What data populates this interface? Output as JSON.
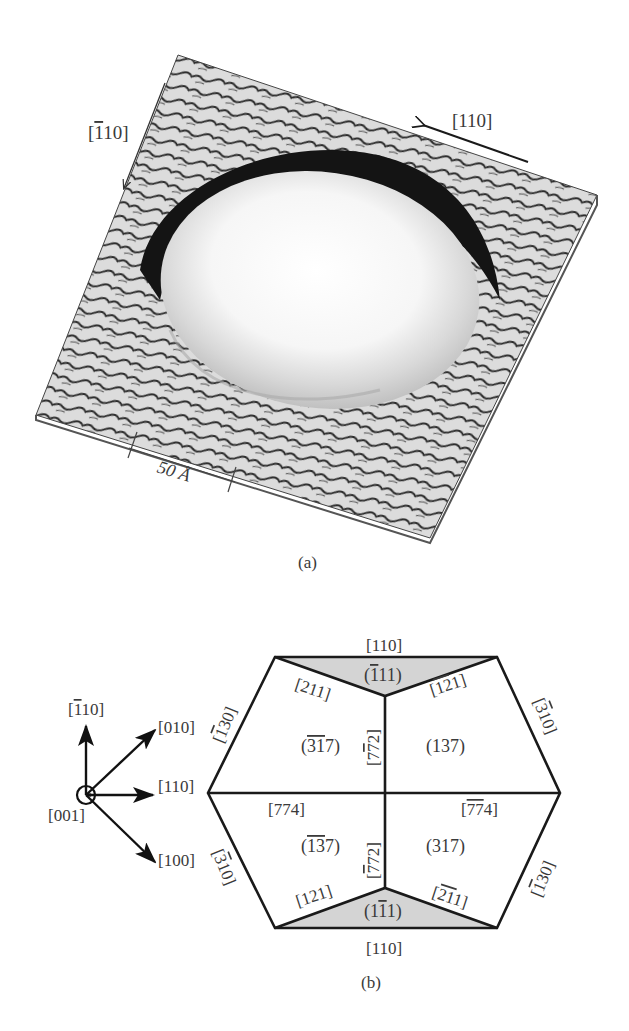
{
  "panel_a": {
    "caption": "(a)",
    "arrow_left_label": {
      "bar": "1",
      "rest": "10",
      "full": "[1̅ 10]"
    },
    "arrow_right_label": "[110]",
    "scale_bar_label": "50 Å",
    "image_description": "3D STM topograph of an island on a stepped surface"
  },
  "panel_b": {
    "caption": "(b)",
    "axes": {
      "origin_label": "[001]",
      "up_label": "[110] with bar on first 1",
      "up": {
        "bar": "1",
        "rest": "10"
      },
      "upper_right": "[010]",
      "right": "[110]",
      "lower_right": "[100]"
    },
    "edges": {
      "top": "[110]",
      "bottom": "[110]",
      "upper_left": {
        "pre": "",
        "bar": "1",
        "post": "30"
      },
      "upper_right": {
        "pre": "",
        "bar": "3",
        "post": "10"
      },
      "lower_left": {
        "pre": "",
        "bar": "3",
        "post": "10"
      },
      "lower_right": {
        "pre": "",
        "bar": "1",
        "post": "30"
      },
      "top_left_inner": "[211]",
      "top_right_inner": {
        "pre": "",
        "bar": "12",
        "post": "1"
      },
      "bottom_left_inner": "[121]",
      "bottom_right_inner": {
        "pre": "",
        "bar": "21",
        "post": "1"
      },
      "center_left": "[774]",
      "center_right": {
        "pre": "",
        "bar": "77",
        "post": "4"
      },
      "vertical_upper": {
        "pre": "7",
        "bar": "7",
        "post": "2"
      },
      "vertical_lower": {
        "pre": "",
        "bar": "7",
        "post": "72"
      }
    },
    "facets": {
      "top_triangle": {
        "pre": "(",
        "bar": "1",
        "post": "11)"
      },
      "bottom_triangle": {
        "pre": "(1",
        "bar": "1",
        "post": "1)"
      },
      "upper_left": {
        "pre": "(",
        "bar": "31",
        "post": "7)"
      },
      "upper_right": "(137)",
      "lower_left": {
        "pre": "(",
        "bar": "13",
        "post": "7)"
      },
      "lower_right": "(317)"
    },
    "colors": {
      "line": "#1a1a1a",
      "facet_shade": "#d4d4d4",
      "text": "#3a3a3a"
    }
  }
}
